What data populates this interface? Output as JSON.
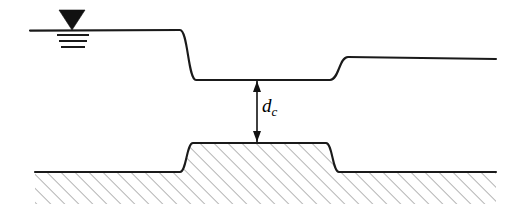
{
  "figure": {
    "kind": "engineering-diagram",
    "background_color": "#ffffff",
    "line_color": "#1a1a1a",
    "hatch_color": "#6e6e6e"
  },
  "annotations": {
    "critical_depth_symbol": "d",
    "critical_depth_subscript": "c",
    "critical_depth_full": "dc"
  },
  "free_surface_marker": {
    "name": "water-level-symbol",
    "triangle_center_x": 72,
    "triangle_top_y": 10,
    "triangle_half_width": 13,
    "triangle_bottom_y": 30,
    "tick_lines": [
      {
        "x1": 57,
        "x2": 89,
        "y": 35
      },
      {
        "x1": 59,
        "x2": 87,
        "y": 41
      },
      {
        "x1": 61,
        "x2": 85,
        "y": 47
      }
    ]
  },
  "water_surface": {
    "name": "water-surface-profile",
    "upstream_level_y": 30,
    "crest_level_y": 80,
    "downstream_level_y": 57,
    "start_x": 30,
    "end_x": 496,
    "drawdown_start_x": 180,
    "drawdown_end_x": 196,
    "recovery_start_x": 330,
    "recovery_end_x": 348,
    "stroke_width": 2.1
  },
  "channel_bed": {
    "name": "channel-bed-profile",
    "bed_level_y": 172,
    "hump_crest_y": 143,
    "start_x": 35,
    "end_x": 496,
    "hump_left_start_x": 180,
    "hump_left_end_x": 193,
    "hump_right_start_x": 326,
    "hump_right_end_x": 339,
    "stroke_width": 2.1,
    "hatch_spacing": 7,
    "hatch_angle_deg": 45,
    "hatch_stroke_width": 1.0
  },
  "dimension": {
    "name": "critical-depth-dimension",
    "x": 257,
    "top_y": 81,
    "bottom_y": 142,
    "arrow_head_length": 11,
    "arrow_head_half_width": 4,
    "stroke_width": 1.6
  }
}
